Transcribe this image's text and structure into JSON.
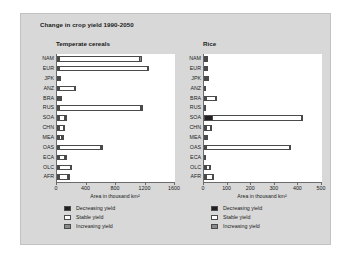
{
  "figure": {
    "title": "Change in crop yield 1990-2050",
    "background_color": "#d8d8d8",
    "plot_background_color": "#ffffff"
  },
  "colors": {
    "decreasing": "#231f20",
    "stable": "#ffffff",
    "increasing": "#8a8a8a",
    "axis": "#6a6a6a"
  },
  "legend": {
    "items": [
      {
        "label": "Decreasing yield",
        "key": "decreasing"
      },
      {
        "label": "Stable yield",
        "key": "stable"
      },
      {
        "label": "Increasing yield",
        "key": "increasing"
      }
    ]
  },
  "chart_data": [
    {
      "type": "bar",
      "orientation": "horizontal",
      "stacked": true,
      "title": "Temperate cereals",
      "xlabel": "Area in thousand km²",
      "ylabel": "",
      "xlim": [
        0,
        1600
      ],
      "xticks": [
        0,
        400,
        800,
        1200,
        1600
      ],
      "xticklabels": [
        "0",
        "400",
        "800",
        "1200",
        "1600"
      ],
      "grid": false,
      "legend_position": "below",
      "categories": [
        "NAM",
        "EUR",
        "JPK",
        "ANZ",
        "BRA",
        "RUS",
        "SOA",
        "CHN",
        "MEA",
        "OAS",
        "ECA",
        "OLC",
        "AFR"
      ],
      "series": [
        {
          "name": "Decreasing yield",
          "values": [
            10,
            8,
            2,
            30,
            12,
            10,
            30,
            18,
            10,
            10,
            5,
            8,
            25
          ]
        },
        {
          "name": "Stable yield",
          "values": [
            1100,
            1210,
            6,
            215,
            10,
            1120,
            90,
            70,
            48,
            580,
            90,
            165,
            130
          ]
        },
        {
          "name": "Increasing yield",
          "values": [
            45,
            15,
            0,
            8,
            2,
            25,
            5,
            12,
            2,
            25,
            5,
            10,
            5
          ]
        }
      ]
    },
    {
      "type": "bar",
      "orientation": "horizontal",
      "stacked": true,
      "title": "Rice",
      "xlabel": "Area in thousand km²",
      "ylabel": "",
      "xlim": [
        0,
        500
      ],
      "xticks": [
        0,
        100,
        200,
        300,
        400,
        500
      ],
      "xticklabels": [
        "0",
        "100",
        "200",
        "300",
        "400",
        "500"
      ],
      "grid": false,
      "legend_position": "below",
      "categories": [
        "NAM",
        "EUR",
        "JPK",
        "ANZ",
        "BRA",
        "RUS",
        "SOA",
        "CHN",
        "MEA",
        "OAS",
        "ECA",
        "OLC",
        "AFR"
      ],
      "series": [
        {
          "name": "Decreasing yield",
          "values": [
            4,
            3,
            1,
            0,
            3,
            0,
            38,
            4,
            1,
            5,
            0,
            4,
            5
          ]
        },
        {
          "name": "Stable yield",
          "values": [
            2,
            1,
            9,
            1,
            44,
            1,
            378,
            22,
            1,
            358,
            1,
            17,
            30
          ]
        },
        {
          "name": "Increasing yield",
          "values": [
            0,
            0,
            1,
            0,
            2,
            0,
            6,
            2,
            0,
            4,
            0,
            1,
            2
          ]
        }
      ]
    }
  ]
}
